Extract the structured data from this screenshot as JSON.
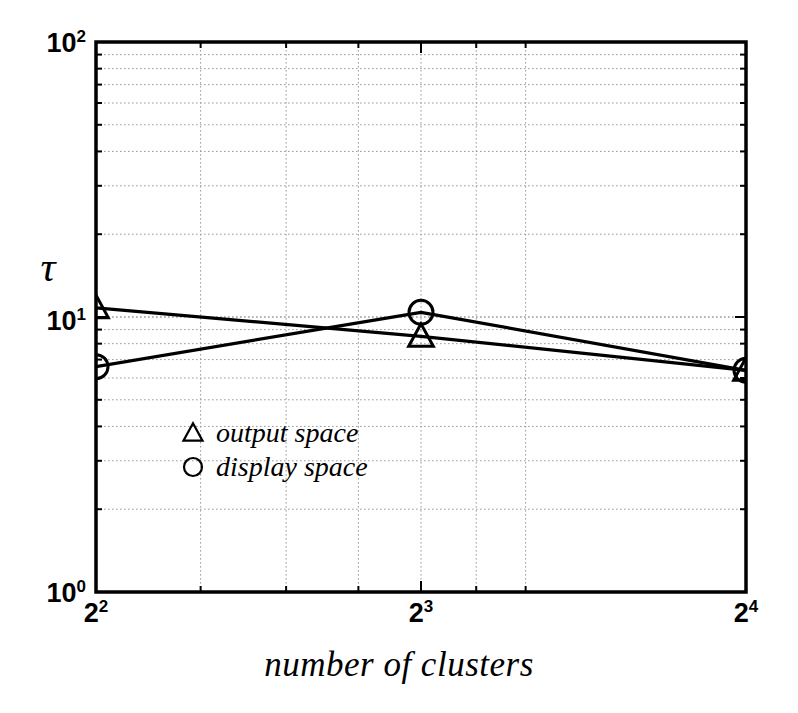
{
  "chart_data": {
    "type": "line",
    "title": "",
    "subtitle": "",
    "xlabel": "number of clusters",
    "ylabel": "τ",
    "xscale": "log",
    "yscale": "log",
    "xlim": [
      4,
      16
    ],
    "ylim": [
      1,
      100
    ],
    "grid": true,
    "legend_position": "inside-lower-left",
    "x": [
      4,
      8,
      16
    ],
    "xtick_labels": [
      "2²",
      "2³",
      "2⁴"
    ],
    "ytick_labels": [
      "10⁰",
      "10¹",
      "10²"
    ],
    "ytick_values": [
      1,
      10,
      100
    ],
    "series": [
      {
        "name": "output space",
        "marker": "triangle",
        "values": [
          10.8,
          8.5,
          6.4
        ]
      },
      {
        "name": "display space",
        "marker": "circle",
        "values": [
          6.6,
          10.4,
          6.4
        ]
      }
    ]
  },
  "axes": {
    "y": {
      "ticks": [
        {
          "mantissa": "10",
          "exponent": "0"
        },
        {
          "mantissa": "10",
          "exponent": "1"
        },
        {
          "mantissa": "10",
          "exponent": "2"
        }
      ]
    },
    "x": {
      "ticks": [
        {
          "mantissa": "2",
          "exponent": "2"
        },
        {
          "mantissa": "2",
          "exponent": "3"
        },
        {
          "mantissa": "2",
          "exponent": "4"
        }
      ]
    },
    "xlabel": "number of clusters",
    "ylabel": "τ"
  },
  "legend": {
    "entries": [
      {
        "marker": "triangle",
        "label": "output space"
      },
      {
        "marker": "circle",
        "label": "display space"
      }
    ]
  },
  "colors": {
    "foreground": "#000000",
    "background": "#ffffff",
    "grid": "#9a9a9a"
  }
}
